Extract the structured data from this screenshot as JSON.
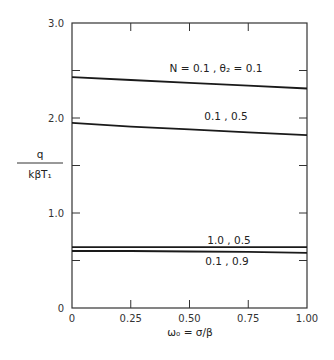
{
  "chart_data": {
    "type": "line",
    "title": "",
    "xlabel": "ω₀ = σ/β",
    "ylabel": "q / kβT₁",
    "ylabel_numerator": "q",
    "ylabel_denominator": "kβT₁",
    "xlim": [
      0,
      1.0
    ],
    "ylim": [
      0,
      3.0
    ],
    "grid": false,
    "legend_position": "inline labels",
    "x_ticks": [
      "0",
      "0.25",
      "0.50",
      "0.75",
      "1.00"
    ],
    "y_ticks": [
      "0",
      "1.0",
      "2.0",
      "3.0"
    ],
    "y_minor_ticks": [
      0.5,
      1.5,
      2.5
    ],
    "x": [
      0,
      0.25,
      0.5,
      0.75,
      1.0
    ],
    "series": [
      {
        "name": "N = 0.1, θ₂ = 0.1",
        "label": "N = 0.1 ,  θ₂ = 0.1",
        "values": [
          2.43,
          2.4,
          2.37,
          2.34,
          2.31
        ]
      },
      {
        "name": "0.1, 0.5",
        "label": "0.1 , 0.5",
        "values": [
          1.95,
          1.91,
          1.88,
          1.85,
          1.82
        ]
      },
      {
        "name": "1.0, 0.5",
        "label": "1.0 , 0.5",
        "values": [
          0.64,
          0.64,
          0.64,
          0.64,
          0.64
        ]
      },
      {
        "name": "0.1, 0.9",
        "label": "0.1 , 0.9",
        "values": [
          0.6,
          0.6,
          0.595,
          0.59,
          0.58
        ]
      }
    ]
  }
}
